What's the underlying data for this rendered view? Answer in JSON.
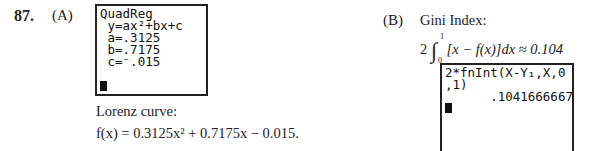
{
  "problem": {
    "number": "87.",
    "part_a": {
      "label": "(A)",
      "screen_lines": [
        "QuadReg",
        " y=ax²+bx+c",
        " a=.3125",
        " b=.7175",
        " c=⁻.015"
      ],
      "caption": "Lorenz curve:",
      "equation": "f(x) = 0.3125x² + 0.7175x − 0.015."
    },
    "part_b": {
      "label": "(B)",
      "title": "Gini Index:",
      "coef": "2",
      "upper": "1",
      "lower": "0",
      "integrand": "[x − f(x)]dx ≈ 0.104",
      "screen_lines": [
        "2*fnInt(X-Y₁,X,0",
        ",1)",
        "      .1041666667"
      ]
    }
  }
}
